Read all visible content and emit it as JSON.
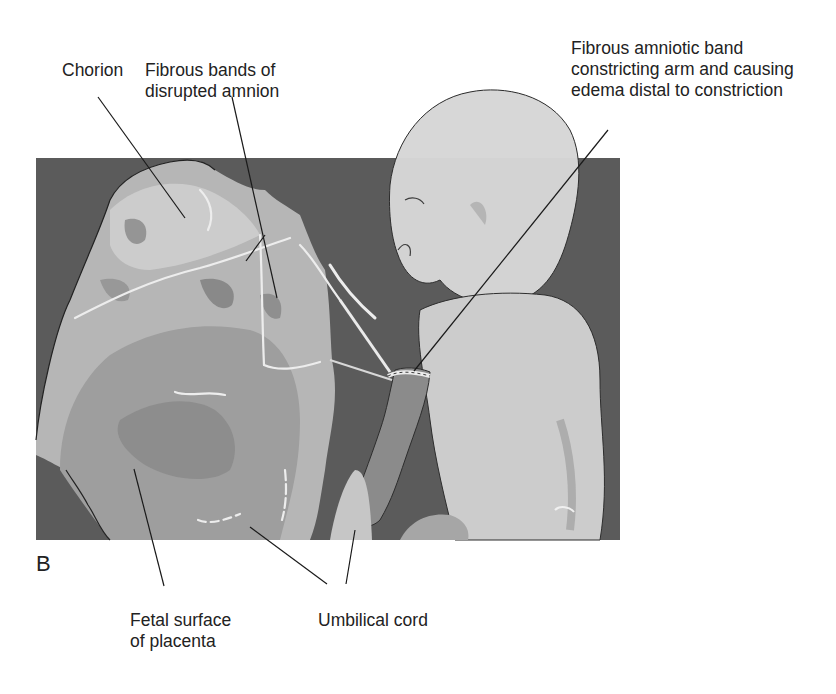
{
  "figure": {
    "panel_letter": "B",
    "background_color": "#5a5a5a",
    "labels": {
      "chorion": {
        "lines": [
          "Chorion"
        ]
      },
      "fibrous_bands": {
        "lines": [
          "Fibrous bands  of",
          "disrupted amnion"
        ]
      },
      "amniotic_band": {
        "lines": [
          "Fibrous amniotic band",
          "constricting arm and causing",
          "edema distal to constriction"
        ]
      },
      "fetal_surface": {
        "lines": [
          "Fetal surface",
          "of placenta"
        ]
      },
      "umbilical_cord": {
        "lines": [
          "Umbilical cord"
        ]
      }
    },
    "illustration": {
      "subjects": [
        "placenta-with-membranes",
        "infant",
        "umbilical-cord",
        "constricting-amniotic-band"
      ]
    }
  }
}
